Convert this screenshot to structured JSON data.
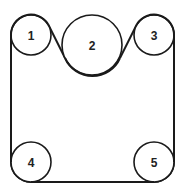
{
  "diagram": {
    "type": "belt-and-pulley",
    "pulleys": [
      {
        "id": "1",
        "label": "1",
        "cx": 31,
        "cy": 35,
        "r": 20
      },
      {
        "id": "2",
        "label": "2",
        "cx": 92,
        "cy": 45,
        "r": 30
      },
      {
        "id": "3",
        "label": "3",
        "cx": 154,
        "cy": 35,
        "r": 20
      },
      {
        "id": "4",
        "label": "4",
        "cx": 31,
        "cy": 162,
        "r": 20
      },
      {
        "id": "5",
        "label": "5",
        "cx": 154,
        "cy": 162,
        "r": 20
      }
    ],
    "colors": {
      "stroke": "#1a1a1a",
      "background": "#ffffff"
    }
  }
}
